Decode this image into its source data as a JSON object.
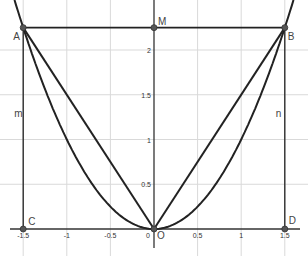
{
  "diagram": {
    "type": "geometry-plot",
    "colors": {
      "background": "#ffffff",
      "grid": "#d9d9d9",
      "axis": "#333333",
      "curve": "#222222",
      "point": "#555555"
    },
    "view": {
      "xmin": -1.65,
      "xmax": 1.75,
      "ymin": -0.3,
      "ymax": 2.55
    },
    "x_ticks": [
      {
        "value": -1.5,
        "label": "-1.5"
      },
      {
        "value": -1,
        "label": "-1"
      },
      {
        "value": -0.5,
        "label": "-0.5"
      },
      {
        "value": 0,
        "label": "0"
      },
      {
        "value": 0.5,
        "label": "0.5"
      },
      {
        "value": 1,
        "label": "1"
      },
      {
        "value": 1.5,
        "label": "1.5"
      }
    ],
    "y_ticks": [
      {
        "value": 0.5,
        "label": "0.5"
      },
      {
        "value": 1,
        "label": "1"
      },
      {
        "value": 1.5,
        "label": "1.5"
      },
      {
        "value": 2,
        "label": "2"
      }
    ],
    "points": {
      "A": {
        "label": "A",
        "x": -1.5,
        "y": 2.25
      },
      "B": {
        "label": "B",
        "x": 1.5,
        "y": 2.25
      },
      "M": {
        "label": "M",
        "x": 0,
        "y": 2.25
      },
      "C": {
        "label": "C",
        "x": -1.5,
        "y": 0
      },
      "D": {
        "label": "D",
        "x": 1.5,
        "y": 0
      },
      "O": {
        "label": "O",
        "x": 0,
        "y": 0
      }
    },
    "lines": {
      "m": {
        "label": "m",
        "x": -1.5
      },
      "n": {
        "label": "n",
        "x": 1.5
      },
      "AB": {
        "label": "",
        "y": 2.25
      }
    },
    "curves": [
      {
        "name": "parabola",
        "equation": "y = x^2"
      },
      {
        "name": "segment-OA",
        "from": "O",
        "to": "A"
      },
      {
        "name": "segment-OB",
        "from": "O",
        "to": "B"
      }
    ]
  }
}
